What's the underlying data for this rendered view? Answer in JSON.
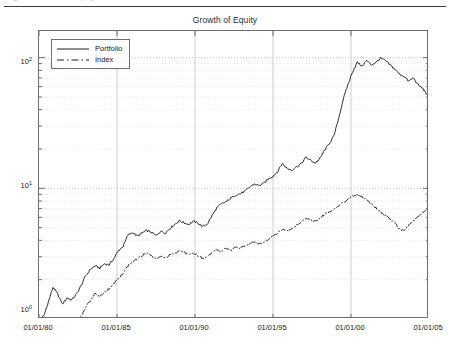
{
  "document": {
    "header_text": "Figure 12 - Growth of Equity"
  },
  "figure": {
    "title": "Growth of Equity"
  },
  "legend": {
    "position": "top-left",
    "items": [
      {
        "label": "Portfolio",
        "style": "solid",
        "color": "#1a1a1a"
      },
      {
        "label": "Index",
        "style": "dash-dot",
        "color": "#1a1a1a"
      }
    ]
  },
  "axes": {
    "y_ticks": [
      {
        "mantissa": "10",
        "exponent": "0",
        "value": 1
      },
      {
        "mantissa": "10",
        "exponent": "1",
        "value": 10
      },
      {
        "mantissa": "10",
        "exponent": "2",
        "value": 100
      }
    ],
    "x_ticks": [
      "01/01/80",
      "01/01/85",
      "01/01/90",
      "01/01/95",
      "01/01/00",
      "01/01/05"
    ]
  },
  "chart_data": {
    "type": "line",
    "title": "Growth of Equity",
    "xlabel": "",
    "ylabel": "",
    "yscale": "log",
    "ylim": [
      1,
      160
    ],
    "xlim": [
      "01/01/80",
      "01/01/05"
    ],
    "grid": true,
    "grid_style": "dotted-minor-log",
    "legend_position": "top-left",
    "x_tick_labels": [
      "01/01/80",
      "01/01/85",
      "01/01/90",
      "01/01/95",
      "01/01/00",
      "01/01/05"
    ],
    "y_tick_labels": [
      "10^0",
      "10^1",
      "10^2"
    ],
    "x": [
      1980.0,
      1980.3,
      1980.6,
      1980.9,
      1981.2,
      1981.5,
      1981.8,
      1982.1,
      1982.4,
      1982.7,
      1983.0,
      1983.3,
      1983.6,
      1983.9,
      1984.2,
      1984.5,
      1984.8,
      1985.1,
      1985.4,
      1985.7,
      1986.0,
      1986.3,
      1986.6,
      1986.9,
      1987.2,
      1987.5,
      1987.8,
      1988.1,
      1988.4,
      1988.7,
      1989.0,
      1989.3,
      1989.6,
      1989.9,
      1990.2,
      1990.5,
      1990.8,
      1991.1,
      1991.4,
      1991.7,
      1992.0,
      1992.3,
      1992.6,
      1992.9,
      1993.2,
      1993.5,
      1993.8,
      1994.1,
      1994.4,
      1994.7,
      1995.0,
      1995.3,
      1995.6,
      1995.9,
      1996.2,
      1996.5,
      1996.8,
      1997.1,
      1997.4,
      1997.7,
      1998.0,
      1998.3,
      1998.6,
      1998.9,
      1999.2,
      1999.5,
      1999.8,
      2000.1,
      2000.4,
      2000.7,
      2001.0,
      2001.3,
      2001.6,
      2001.9,
      2002.2,
      2002.5,
      2002.8,
      2003.1,
      2003.4,
      2003.7,
      2004.0,
      2004.3,
      2004.6,
      2004.9
    ],
    "series": [
      {
        "name": "Portfolio",
        "style": "solid",
        "color": "#1a1a1a",
        "start_value": 1.0,
        "peak_value": 100,
        "peak_date": "1999-2000",
        "end_value": 52,
        "values": [
          1.0,
          1.05,
          1.35,
          1.75,
          1.55,
          1.3,
          1.45,
          1.4,
          1.55,
          1.8,
          2.15,
          2.4,
          2.55,
          2.45,
          2.65,
          2.6,
          2.9,
          3.35,
          3.6,
          4.4,
          4.6,
          4.3,
          4.55,
          4.75,
          4.6,
          4.35,
          4.7,
          4.55,
          4.95,
          5.3,
          5.65,
          5.45,
          5.3,
          5.6,
          5.4,
          5.1,
          5.35,
          6.2,
          7.1,
          7.6,
          7.9,
          8.4,
          8.9,
          9.1,
          9.5,
          10.2,
          10.8,
          10.5,
          10.9,
          11.8,
          12.4,
          13.5,
          15.5,
          14.2,
          13.8,
          14.6,
          15.4,
          17.2,
          16.4,
          15.6,
          16.8,
          19.5,
          22.0,
          25.0,
          34.0,
          48.0,
          62.0,
          78.0,
          92.0,
          86.0,
          95.0,
          88.0,
          92.0,
          99.0,
          95.0,
          88.0,
          82.0,
          75.0,
          72.0,
          66.0,
          70.0,
          62.0,
          58.0,
          52.0
        ]
      },
      {
        "name": "Index",
        "style": "dash-dot",
        "color": "#1a1a1a",
        "start_value": 1.0,
        "peak_value": 9.0,
        "peak_date": "2000",
        "end_value": 7.0,
        "values": [
          1.0,
          0.95,
          0.9,
          0.88,
          0.82,
          0.78,
          0.75,
          0.8,
          0.9,
          1.05,
          1.25,
          1.4,
          1.55,
          1.5,
          1.62,
          1.7,
          1.85,
          2.05,
          2.25,
          2.55,
          2.75,
          2.9,
          3.05,
          3.2,
          3.1,
          2.85,
          3.0,
          2.95,
          3.1,
          3.2,
          3.35,
          3.25,
          3.1,
          3.2,
          3.05,
          2.9,
          3.0,
          3.25,
          3.4,
          3.3,
          3.45,
          3.35,
          3.55,
          3.5,
          3.65,
          3.8,
          3.9,
          3.75,
          3.85,
          4.05,
          4.3,
          4.55,
          4.85,
          4.7,
          4.9,
          5.2,
          5.45,
          5.85,
          5.7,
          5.55,
          5.9,
          6.3,
          6.6,
          6.9,
          7.3,
          7.8,
          8.3,
          8.7,
          9.0,
          8.6,
          8.2,
          7.6,
          7.1,
          6.6,
          6.2,
          5.8,
          5.4,
          4.9,
          4.7,
          5.2,
          5.6,
          6.1,
          6.5,
          7.0
        ]
      }
    ]
  }
}
